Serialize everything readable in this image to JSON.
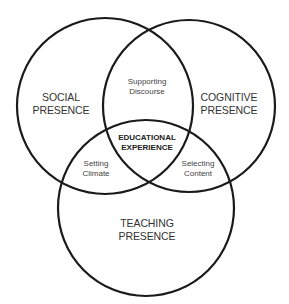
{
  "diagram": {
    "type": "venn",
    "stroke_color": "#1a1a1a",
    "background": "#ffffff",
    "circles": [
      {
        "id": "social",
        "cx": 105,
        "cy": 106,
        "r": 88,
        "label_line1": "SOCIAL",
        "label_line2": "PRESENCE"
      },
      {
        "id": "cognitive",
        "cx": 189,
        "cy": 106,
        "r": 86,
        "label_line1": "COGNITIVE",
        "label_line2": "PRESENCE"
      },
      {
        "id": "teaching",
        "cx": 146,
        "cy": 208,
        "r": 88,
        "label_line1": "TEACHING",
        "label_line2": "PRESENCE"
      }
    ],
    "intersections": {
      "social_cognitive": {
        "line1": "Supporting",
        "line2": "Discourse"
      },
      "social_teaching": {
        "line1": "Setting",
        "line2": "Climate"
      },
      "cognitive_teaching": {
        "line1": "Selecting",
        "line2": "Content"
      },
      "center": {
        "line1": "EDUCATIONAL",
        "line2": "EXPERIENCE"
      }
    }
  }
}
